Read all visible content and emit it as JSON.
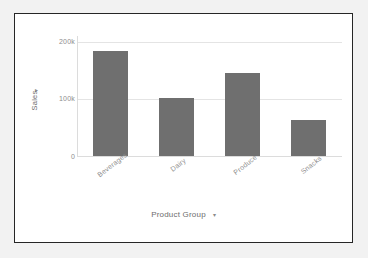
{
  "chart_data": {
    "type": "bar",
    "title": "",
    "subtitle": "",
    "categories": [
      "Beverages",
      "Dairy",
      "Produce",
      "Snacks"
    ],
    "values": [
      184000,
      101000,
      145000,
      63000
    ],
    "series": [
      {
        "name": "Sales",
        "values": [
          184000,
          101000,
          145000,
          63000
        ]
      }
    ],
    "xlabel": "Product Group",
    "ylabel": "Sales",
    "ylim": [
      0,
      210000
    ],
    "yticks": [
      0,
      100000,
      200000
    ],
    "ytick_labels": [
      "0",
      "100k",
      "200k"
    ],
    "xtick_labels": [
      "Beverages",
      "Dairy",
      "Produce",
      "Snacks"
    ],
    "xtick_rotation": -38,
    "grid": true,
    "grid_axis": "y",
    "legend": false,
    "legend_position": "none",
    "bar_color": "#6f6f6f",
    "gridline_color": "#e4e4e4",
    "axis_color": "#dcdcdc",
    "tick_label_color": "#8d8d8d",
    "axis_title_color": "#6d6d6d",
    "frame_color": "#262626",
    "background_color": "#ffffff",
    "canvas_color": "#f2f2f2",
    "annotations": []
  },
  "axes": {
    "y": {
      "title": "Sales",
      "dropdown_caret": "▾",
      "ticks": [
        {
          "label": "200k",
          "value": 200000
        },
        {
          "label": "100k",
          "value": 100000
        },
        {
          "label": "0",
          "value": 0
        }
      ]
    },
    "x": {
      "title": "Product Group",
      "dropdown_caret": "▾",
      "ticks": [
        {
          "label": "Beverages"
        },
        {
          "label": "Dairy"
        },
        {
          "label": "Produce"
        },
        {
          "label": "Snacks"
        }
      ]
    }
  }
}
